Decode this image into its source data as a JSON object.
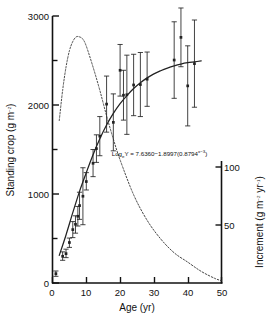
{
  "figure": {
    "background": "#ffffff",
    "ink": "#111111"
  },
  "axes": {
    "x": {
      "label": "Age (yr)",
      "ticks": [
        0,
        10,
        20,
        30,
        40,
        50
      ],
      "tick_labels": [
        "0",
        "10",
        "20",
        "30",
        "40",
        "50"
      ],
      "min": 0,
      "max": 50
    },
    "y_left": {
      "label_main": "Standing crop (g m",
      "label_sup": "−2",
      "label_close": ")",
      "label_full": "Standing crop (g m−2)",
      "ticks": [
        0,
        500,
        1000,
        1500,
        2000,
        2500,
        3000
      ],
      "major_ticks": [
        0,
        1000,
        2000,
        3000
      ],
      "tick_labels": [
        "0",
        "1000",
        "2000",
        "3000"
      ],
      "min": 0,
      "max": 3000
    },
    "y_right": {
      "label_main": "Increment (g m",
      "label_sup1": "−2",
      "label_mid": " yr",
      "label_sup2": "−1",
      "label_close": ")",
      "label_full": "Increment (g m−2 yr−1)",
      "ticks": [
        0,
        50,
        100
      ],
      "tick_labels": [
        "50",
        "100"
      ],
      "labeled_ticks": [
        50,
        100
      ],
      "min": 0,
      "max": 115
    }
  },
  "annotation": {
    "equation_parts": {
      "log": "Log",
      "base": "e",
      "body": "Y = 7.6360−1.8997(0.8794",
      "exponent": "x−3",
      "tail": ")"
    },
    "equation_text": "LogₑY = 7.6360−1.8997(0.8794^(x−3))",
    "x_pos_yr": 17.5,
    "y_pos_crop": 1430
  },
  "chart_data": {
    "type": "scatter",
    "title": "",
    "xlabel": "Age (yr)",
    "ylabel": "Standing crop (g m−2)",
    "y2label": "Increment (g m−2 yr−1)",
    "xlim": [
      0,
      50
    ],
    "ylim": [
      0,
      3000
    ],
    "y2lim": [
      0,
      115
    ],
    "grid": false,
    "legend": "none",
    "series": [
      {
        "name": "Standing crop observations",
        "type": "scatter_errorbar",
        "marker": "filled-square",
        "color": "#222222",
        "points": [
          {
            "x": 1,
            "y": 105,
            "lo": 75,
            "hi": 135
          },
          {
            "x": 3,
            "y": 300,
            "lo": 255,
            "hi": 350
          },
          {
            "x": 4,
            "y": 330,
            "lo": 285,
            "hi": 380
          },
          {
            "x": 5,
            "y": 455,
            "lo": 400,
            "hi": 505
          },
          {
            "x": 6,
            "y": 600,
            "lo": 510,
            "hi": 690
          },
          {
            "x": 6.8,
            "y": 660,
            "lo": 560,
            "hi": 755
          },
          {
            "x": 7.5,
            "y": 750,
            "lo": 640,
            "hi": 860
          },
          {
            "x": 8,
            "y": 870,
            "lo": 715,
            "hi": 1020
          },
          {
            "x": 9,
            "y": 975,
            "lo": 655,
            "hi": 1295
          },
          {
            "x": 10,
            "y": 1140,
            "lo": 1045,
            "hi": 1240
          },
          {
            "x": 12,
            "y": 1345,
            "lo": 1195,
            "hi": 1500
          },
          {
            "x": 13,
            "y": 1510,
            "lo": 1355,
            "hi": 1665
          },
          {
            "x": 14,
            "y": 1650,
            "lo": 1430,
            "hi": 1870
          },
          {
            "x": 16,
            "y": 2010,
            "lo": 1695,
            "hi": 2325
          },
          {
            "x": 18,
            "y": 1805,
            "lo": 1485,
            "hi": 2125
          },
          {
            "x": 20,
            "y": 2390,
            "lo": 2100,
            "hi": 2680
          },
          {
            "x": 21,
            "y": 2110,
            "lo": 1830,
            "hi": 2390
          },
          {
            "x": 22,
            "y": 2115,
            "lo": 1670,
            "hi": 2560
          },
          {
            "x": 24,
            "y": 2225,
            "lo": 1880,
            "hi": 2570
          },
          {
            "x": 26,
            "y": 2230,
            "lo": 1870,
            "hi": 2590
          },
          {
            "x": 28,
            "y": 2290,
            "lo": 1985,
            "hi": 2595
          },
          {
            "x": 36,
            "y": 2505,
            "lo": 2075,
            "hi": 2935
          },
          {
            "x": 38,
            "y": 2760,
            "lo": 2430,
            "hi": 3090
          },
          {
            "x": 40,
            "y": 2215,
            "lo": 1765,
            "hi": 2665
          },
          {
            "x": 42,
            "y": 2465,
            "lo": 1975,
            "hi": 2955
          }
        ]
      },
      {
        "name": "Fitted standing crop curve (Gompertz)",
        "type": "line",
        "linestyle": "solid",
        "color": "#222222",
        "x": [
          2,
          4,
          6,
          8,
          10,
          12,
          14,
          16,
          18,
          20,
          22,
          24,
          26,
          28,
          30,
          32,
          34,
          36,
          38,
          40,
          42,
          44
        ],
        "y": [
          310,
          540,
          790,
          1030,
          1240,
          1440,
          1620,
          1775,
          1905,
          2015,
          2105,
          2185,
          2250,
          2305,
          2350,
          2385,
          2415,
          2440,
          2460,
          2475,
          2485,
          2495
        ]
      },
      {
        "name": "Increment curve",
        "type": "line",
        "linestyle": "dotted",
        "axis": "right",
        "color": "#333333",
        "x": [
          2,
          3,
          4,
          5,
          6,
          7,
          8,
          9,
          10,
          12,
          14,
          16,
          18,
          20,
          24,
          28,
          32,
          36,
          40,
          44,
          48,
          50
        ],
        "y": [
          70,
          83,
          93,
          100,
          104,
          106,
          106,
          105,
          102,
          93,
          83,
          72,
          62,
          53,
          38,
          27,
          19,
          13,
          9,
          5,
          2,
          1
        ]
      }
    ]
  }
}
